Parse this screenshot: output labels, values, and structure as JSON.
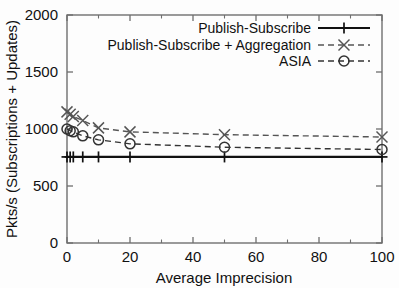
{
  "chart_data": {
    "type": "line",
    "title": "",
    "xlabel": "Average Imprecision",
    "ylabel": "Pkts/s (Subscriptions + Updates)",
    "xlim": [
      0,
      100
    ],
    "ylim": [
      0,
      2000
    ],
    "xticks": [
      0,
      20,
      40,
      60,
      80,
      100
    ],
    "xtick_labels": [
      "0",
      "20",
      "40",
      "60",
      "80",
      "100"
    ],
    "xminor_ticks": [
      10,
      30,
      50,
      70,
      90
    ],
    "yticks": [
      0,
      500,
      1000,
      1500,
      2000
    ],
    "ytick_labels": [
      "0",
      "500",
      "1000",
      "1500",
      "2000"
    ],
    "grid": false,
    "legend_position": "top-right",
    "series": [
      {
        "name": "Publish-Subscribe",
        "marker": "plus",
        "linestyle": "solid",
        "color": "#111111",
        "x": [
          0,
          1,
          2,
          5,
          10,
          20,
          50,
          100
        ],
        "y": [
          755,
          755,
          755,
          755,
          755,
          755,
          755,
          755
        ]
      },
      {
        "name": "Publish-Subscribe + Aggregation",
        "marker": "cross",
        "linestyle": "dashed",
        "color": "#555555",
        "x": [
          0,
          1,
          2,
          5,
          10,
          20,
          50,
          100
        ],
        "y": [
          1150,
          1130,
          1110,
          1075,
          1010,
          975,
          950,
          930
        ]
      },
      {
        "name": "ASIA",
        "marker": "circle",
        "linestyle": "dashed",
        "color": "#333333",
        "x": [
          0,
          1,
          2,
          5,
          10,
          20,
          50,
          100
        ],
        "y": [
          1000,
          985,
          975,
          940,
          905,
          870,
          840,
          820
        ]
      }
    ]
  },
  "axes": {
    "x_label": "Average Imprecision",
    "y_label": "Pkts/s (Subscriptions + Updates)"
  },
  "legend": {
    "entries": [
      {
        "label": "Publish-Subscribe"
      },
      {
        "label": "Publish-Subscribe + Aggregation"
      },
      {
        "label": "ASIA"
      }
    ]
  }
}
